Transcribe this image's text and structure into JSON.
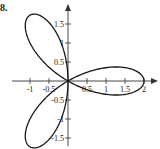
{
  "problem_label": "8.",
  "chart_data": {
    "type": "line",
    "title": "",
    "equation": "r = 2cos(3θ)",
    "xlabel": "",
    "ylabel": "",
    "xlim": [
      -1.1,
      2.2
    ],
    "ylim": [
      -1.7,
      1.8
    ],
    "x_ticks": [
      "-1",
      "-0.5",
      "0.5",
      "1",
      "1.5",
      "2"
    ],
    "y_ticks": [
      "1.5",
      "1",
      "0.5",
      "-0.5",
      "-1",
      "-1.5"
    ],
    "x_tick_values": [
      -1,
      -0.5,
      0.5,
      1,
      1.5,
      2
    ],
    "y_tick_values": [
      1.5,
      1,
      0.5,
      -0.5,
      -1,
      -1.5
    ],
    "petals": [
      {
        "tip_angle_deg": 0,
        "tip": [
          2,
          0
        ]
      },
      {
        "tip_angle_deg": 120,
        "tip": [
          -1,
          1.732
        ]
      },
      {
        "tip_angle_deg": 240,
        "tip": [
          -1,
          -1.732
        ]
      }
    ],
    "grid": false,
    "legend": null,
    "line_color": "#1a1a1a",
    "axis_color": "#333333"
  }
}
